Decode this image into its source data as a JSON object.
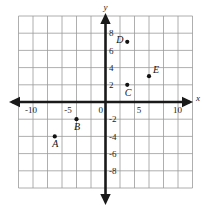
{
  "chart_data": {
    "type": "scatter",
    "title": "",
    "xlabel": "x",
    "ylabel": "y",
    "xlim": [
      -12,
      12
    ],
    "ylim": [
      -10,
      10
    ],
    "grid": true,
    "grid_step": 2,
    "legend": "none",
    "x_tick_labels": [
      "-10",
      "-5",
      "0",
      "5",
      "10"
    ],
    "x_tick_values": [
      -10,
      -5,
      0,
      5,
      10
    ],
    "y_tick_labels": [
      "8",
      "6",
      "4",
      "2",
      "-2",
      "-4",
      "-6",
      "-8"
    ],
    "y_tick_values": [
      8,
      6,
      4,
      2,
      -2,
      -4,
      -6,
      -8
    ],
    "points": [
      {
        "label": "A",
        "x": -7,
        "y": -4,
        "label_pos": "below"
      },
      {
        "label": "B",
        "x": -4,
        "y": -2,
        "label_pos": "below"
      },
      {
        "label": "C",
        "x": 3,
        "y": 2,
        "label_pos": "below"
      },
      {
        "label": "D",
        "x": 3,
        "y": 7,
        "label_pos": "left"
      },
      {
        "label": "E",
        "x": 6,
        "y": 3,
        "label_pos": "upper-right"
      }
    ],
    "colors": {
      "grid": "#9a9a9a",
      "axis": "#1a1a1a",
      "point": "#121212",
      "background": "#ffffff"
    }
  }
}
